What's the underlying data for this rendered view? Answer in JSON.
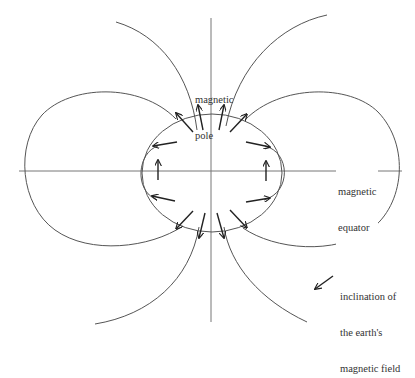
{
  "diagram": {
    "labels": {
      "pole": [
        "magnetic",
        "pole"
      ],
      "equator": [
        "magnetic",
        "equator"
      ],
      "legend": [
        "inclination of",
        "the earth's",
        "magnetic field"
      ]
    },
    "elements": {
      "globe": "earth circle",
      "field_lines": "dipole magnetic field lines",
      "axes": [
        "magnetic axis (vertical)",
        "magnetic equator (horizontal)"
      ],
      "arrows": "inclination arrows around globe"
    },
    "colors": {
      "lines": "#555555",
      "arrows": "#222222",
      "text": "#333333",
      "background": "#ffffff"
    }
  }
}
